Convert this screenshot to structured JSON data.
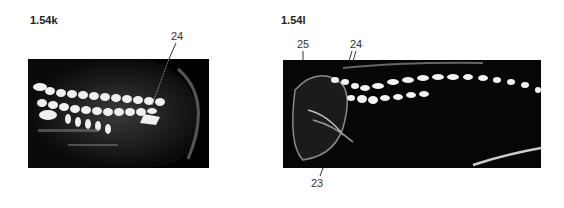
{
  "figures": [
    {
      "id": "k",
      "label": "1.54k",
      "callouts": [
        {
          "text": "24"
        }
      ]
    },
    {
      "id": "l",
      "label": "1.54l",
      "callouts": [
        {
          "text": "25"
        },
        {
          "text": "24"
        },
        {
          "text": "23"
        }
      ]
    }
  ],
  "colors": {
    "background": "#ffffff",
    "image_dark": "#050505",
    "echo_bright": "#f4f4f4"
  }
}
